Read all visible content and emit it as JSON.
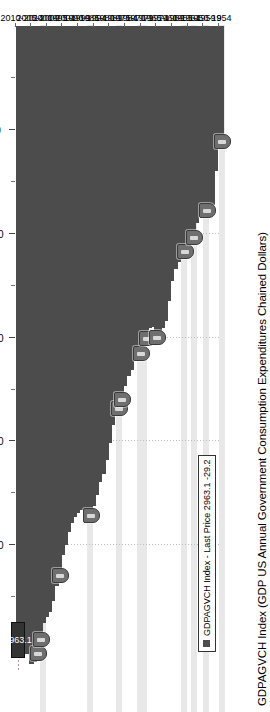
{
  "chart_data": {
    "type": "bar",
    "title": "GDPAGVCH Index (GDP US Annual Government Consumption Expenditures Chained Dollars)",
    "orientation": "horizontal",
    "xlabel": "",
    "ylabel": "",
    "grid": true,
    "legend_position": "bottom-left",
    "value_axis": {
      "ticks": [
        2500,
        2000,
        1500,
        1000,
        500
      ],
      "tick_labels": [
        "2500",
        "2000",
        "1500",
        "1000",
        "500"
      ],
      "range": [
        0,
        3100
      ],
      "direction": "descending-left-to-right"
    },
    "category_axis": {
      "group_labels": [
        "2010-2014",
        "2005-2009",
        "2000-2004",
        "1995-1999",
        "1990-1994",
        "1985-1989",
        "1980-1984",
        "1975-1979",
        "1970-1974",
        "1965-1969",
        "1960-1964",
        "1955-1959",
        "1950-1954",
        "9"
      ]
    },
    "categories": [
      "2014",
      "2013",
      "2012",
      "2011",
      "2010",
      "2009",
      "2008",
      "2007",
      "2006",
      "2005",
      "2004",
      "2003",
      "2002",
      "2001",
      "2000",
      "1999",
      "1998",
      "1997",
      "1996",
      "1995",
      "1994",
      "1993",
      "1992",
      "1991",
      "1990",
      "1989",
      "1988",
      "1987",
      "1986",
      "1985",
      "1984",
      "1983",
      "1982",
      "1981",
      "1980",
      "1979",
      "1978",
      "1977",
      "1976",
      "1975",
      "1974",
      "1973",
      "1972",
      "1971",
      "1970",
      "1969",
      "1968",
      "1967",
      "1966",
      "1965",
      "1964",
      "1963",
      "1962",
      "1961",
      "1960",
      "1959",
      "1958",
      "1957",
      "1956",
      "1955",
      "1954",
      "1953",
      "1952",
      "1951",
      "1950",
      "1949"
    ],
    "values": [
      2963.1,
      2941.0,
      2975.2,
      3022.0,
      3071.0,
      3061.0,
      2989.0,
      2922.0,
      2876.0,
      2846.0,
      2822.0,
      2768.0,
      2698.0,
      2612.0,
      2545.0,
      2496.0,
      2435.0,
      2392.0,
      2362.0,
      2342.0,
      2331.0,
      2329.0,
      2336.0,
      2326.0,
      2310.0,
      2257.0,
      2197.0,
      2156.0,
      2090.0,
      2008.0,
      1920.0,
      1853.0,
      1809.0,
      1767.0,
      1735.0,
      1683.0,
      1656.0,
      1604.0,
      1563.0,
      1545.0,
      1520.0,
      1475.0,
      1456.0,
      1451.0,
      1468.0,
      1470.0,
      1455.0,
      1418.0,
      1325.0,
      1229.0,
      1170.0,
      1137.0,
      1113.0,
      1053.0,
      1015.0,
      999.0,
      985.0,
      949.0,
      897.0,
      862.0,
      855.0,
      902.0,
      860.0,
      700.0,
      546.0,
      525.0
    ],
    "series_color": "#4c4c4c",
    "last_price": {
      "label": "2963.1",
      "value": 2963.1,
      "change": "-29.2"
    },
    "highlight_bands": [
      {
        "category": "2006",
        "label": "highlight-2006"
      },
      {
        "category": "1991",
        "label": "highlight-1991"
      },
      {
        "category": "1982",
        "label": "highlight-1982"
      },
      {
        "category": "1975",
        "label": "highlight-1975"
      },
      {
        "category": "1974",
        "label": "highlight-1974"
      },
      {
        "category": "1961",
        "label": "highlight-1961"
      },
      {
        "category": "1958",
        "label": "highlight-1958"
      },
      {
        "category": "1954",
        "label": "highlight-1954"
      },
      {
        "category": "1949",
        "label": "highlight-1949"
      }
    ],
    "annotation_pins": [
      {
        "category": "2008",
        "name": "recession-pin-2008"
      },
      {
        "category": "2007",
        "name": "recession-pin-2007"
      },
      {
        "category": "2001",
        "name": "recession-pin-2001"
      },
      {
        "category": "1991",
        "name": "recession-pin-1991"
      },
      {
        "category": "1982",
        "name": "recession-pin-1982"
      },
      {
        "category": "1981",
        "name": "recession-pin-1981"
      },
      {
        "category": "1975",
        "name": "recession-pin-1975"
      },
      {
        "category": "1973",
        "name": "recession-pin-1973"
      },
      {
        "category": "1970",
        "name": "recession-pin-1970"
      },
      {
        "category": "1961",
        "name": "recession-pin-1961"
      },
      {
        "category": "1958",
        "name": "recession-pin-1958"
      },
      {
        "category": "1954",
        "name": "recession-pin-1954"
      },
      {
        "category": "1949",
        "name": "recession-pin-1949"
      }
    ]
  },
  "legend": {
    "entry_label": "GDPAGVCH Index - Last Price 2963.1   -29.2",
    "swatch_color": "#4c4c4c"
  }
}
